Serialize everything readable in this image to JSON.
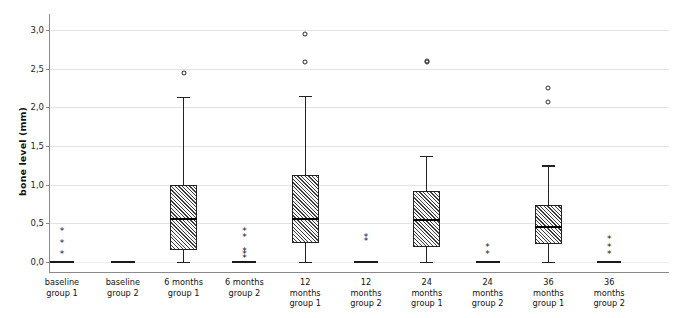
{
  "chart_data": {
    "type": "box",
    "title": "",
    "xlabel": "",
    "ylabel": "bone level (mm)",
    "ylim": [
      0.0,
      3.15
    ],
    "yticks": [
      0.0,
      0.5,
      1.0,
      1.5,
      2.0,
      2.5,
      3.0
    ],
    "ytick_labels": [
      "0,0",
      "0,5",
      "1,0",
      "1,5",
      "2,0",
      "2,5",
      "3,0"
    ],
    "grid": true,
    "legend": "none",
    "categories": [
      "baseline group 1",
      "baseline group 2",
      "6 months group 1",
      "6 months group 2",
      "12 months group 1",
      "12 months group 2",
      "24 months group 1",
      "24 months group 2",
      "36 months group 1",
      "36 months group 2"
    ],
    "category_lines": [
      [
        "baseline",
        "group 1"
      ],
      [
        "baseline",
        "group 2"
      ],
      [
        "6 months",
        "group 1"
      ],
      [
        "6 months",
        "group 2"
      ],
      [
        "12",
        "months",
        "group 1"
      ],
      [
        "12",
        "months",
        "group 2"
      ],
      [
        "24",
        "months",
        "group 1"
      ],
      [
        "24",
        "months",
        "group 2"
      ],
      [
        "36",
        "months",
        "group 1"
      ],
      [
        "36",
        "months",
        "group 2"
      ]
    ],
    "boxes": [
      {
        "category": "baseline group 1",
        "whisker_low": 0.0,
        "q1": 0.0,
        "median": 0.0,
        "q3": 0.0,
        "whisker_high": 0.0,
        "degenerate": true,
        "outliers_star": [
          0.1,
          0.25,
          0.4
        ],
        "outliers_circle": []
      },
      {
        "category": "baseline group 2",
        "whisker_low": 0.0,
        "q1": 0.0,
        "median": 0.0,
        "q3": 0.0,
        "whisker_high": 0.0,
        "degenerate": true,
        "outliers_star": [],
        "outliers_circle": []
      },
      {
        "category": "6 months group 1",
        "whisker_low": 0.0,
        "q1": 0.16,
        "median": 0.56,
        "q3": 1.0,
        "whisker_high": 2.14,
        "degenerate": false,
        "outliers_star": [],
        "outliers_circle": [
          2.45
        ]
      },
      {
        "category": "6 months group 2",
        "whisker_low": 0.0,
        "q1": 0.0,
        "median": 0.0,
        "q3": 0.0,
        "whisker_high": 0.0,
        "degenerate": true,
        "outliers_star": [
          0.05,
          0.1,
          0.14,
          0.32,
          0.4
        ],
        "outliers_circle": []
      },
      {
        "category": "12 months group 1",
        "whisker_low": 0.0,
        "q1": 0.25,
        "median": 0.56,
        "q3": 1.12,
        "whisker_high": 2.15,
        "degenerate": false,
        "outliers_star": [],
        "outliers_circle": [
          2.58,
          2.95
        ]
      },
      {
        "category": "12 months group 2",
        "whisker_low": 0.0,
        "q1": 0.0,
        "median": 0.0,
        "q3": 0.0,
        "whisker_high": 0.0,
        "degenerate": true,
        "outliers_star": [
          0.27,
          0.32
        ],
        "outliers_circle": []
      },
      {
        "category": "24 months group 1",
        "whisker_low": 0.0,
        "q1": 0.19,
        "median": 0.54,
        "q3": 0.92,
        "whisker_high": 1.37,
        "degenerate": false,
        "outliers_star": [],
        "outliers_circle": [
          2.58,
          2.6
        ]
      },
      {
        "category": "24 months group 2",
        "whisker_low": 0.0,
        "q1": 0.0,
        "median": 0.0,
        "q3": 0.0,
        "whisker_high": 0.0,
        "degenerate": true,
        "outliers_star": [
          0.1,
          0.2
        ],
        "outliers_circle": []
      },
      {
        "category": "36 months group 1",
        "whisker_low": 0.0,
        "q1": 0.23,
        "median": 0.45,
        "q3": 0.74,
        "whisker_high": 1.25,
        "degenerate": false,
        "outliers_star": [],
        "outliers_circle": [
          2.07,
          2.25
        ]
      },
      {
        "category": "36 months group 2",
        "whisker_low": 0.0,
        "q1": 0.0,
        "median": 0.0,
        "q3": 0.0,
        "whisker_high": 0.0,
        "degenerate": true,
        "outliers_star": [
          0.1,
          0.2,
          0.3
        ],
        "outliers_circle": []
      }
    ],
    "colors": {
      "box_edge": "#222222",
      "box_fill": "#b9b9b9",
      "median": "#000000",
      "grid": "#e2e2e2",
      "axis": "#8a8a8a",
      "text": "#121212"
    }
  }
}
